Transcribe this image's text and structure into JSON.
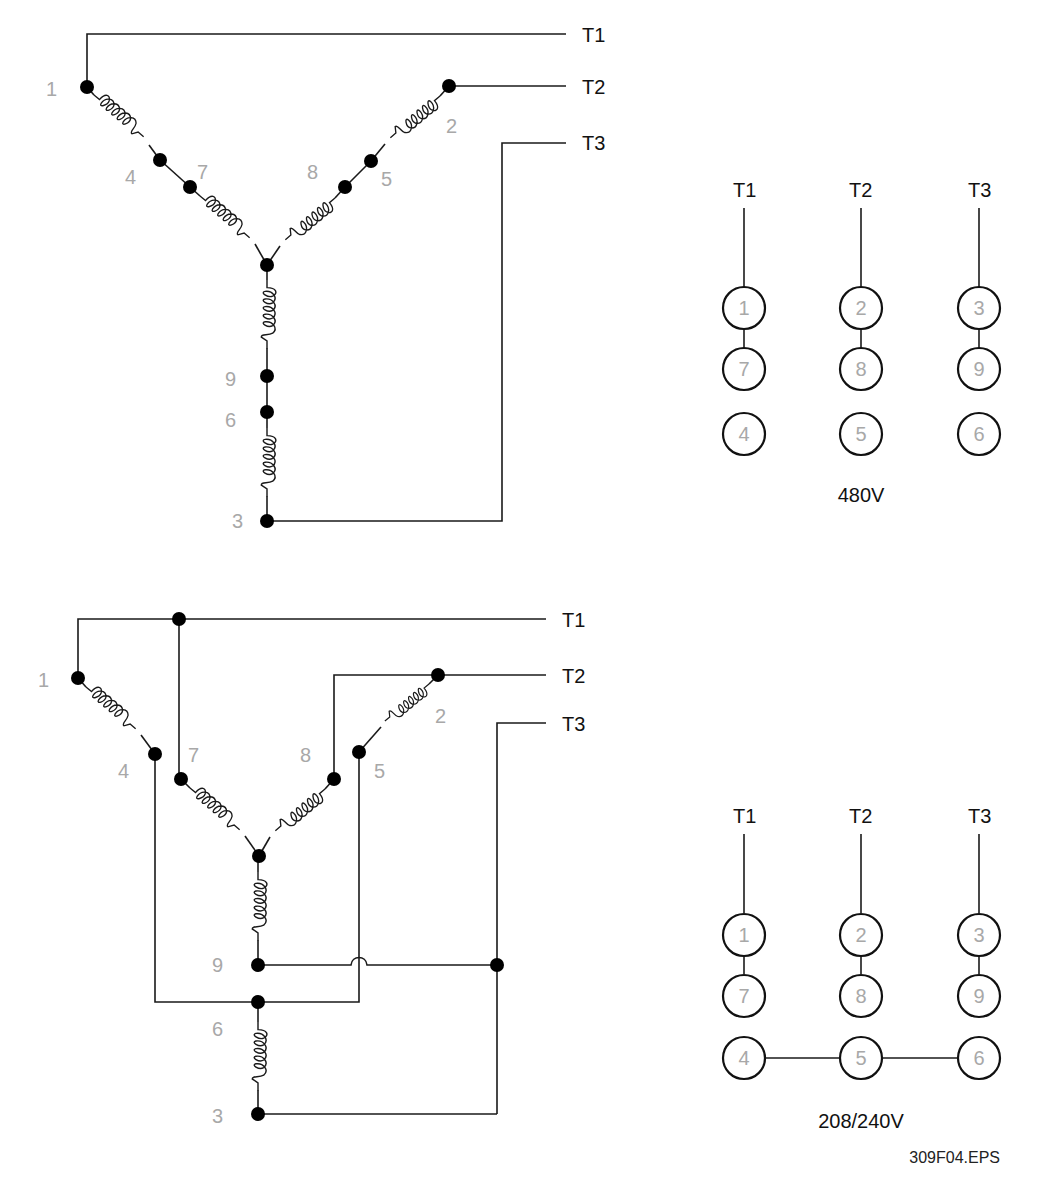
{
  "figure_id": "309F04.EPS",
  "top_diagram": {
    "name": "480V series wye connection",
    "terminals": [
      "T1",
      "T2",
      "T3"
    ],
    "leads": {
      "l1": "1",
      "l2": "2",
      "l3": "3",
      "l4": "4",
      "l5": "5",
      "l6": "6",
      "l7": "7",
      "l8": "8",
      "l9": "9"
    }
  },
  "top_panel": {
    "voltage_label": "480V",
    "columns": [
      {
        "terminal": "T1",
        "rings": [
          "1",
          "7",
          "4"
        ]
      },
      {
        "terminal": "T2",
        "rings": [
          "2",
          "8",
          "5"
        ]
      },
      {
        "terminal": "T3",
        "rings": [
          "3",
          "9",
          "6"
        ]
      }
    ]
  },
  "bottom_diagram": {
    "name": "208/240V parallel wye connection",
    "terminals": [
      "T1",
      "T2",
      "T3"
    ],
    "leads": {
      "l1": "1",
      "l2": "2",
      "l3": "3",
      "l4": "4",
      "l5": "5",
      "l6": "6",
      "l7": "7",
      "l8": "8",
      "l9": "9"
    }
  },
  "bottom_panel": {
    "voltage_label": "208/240V",
    "columns": [
      {
        "terminal": "T1",
        "rings": [
          "1",
          "7",
          "4"
        ]
      },
      {
        "terminal": "T2",
        "rings": [
          "2",
          "8",
          "5"
        ]
      },
      {
        "terminal": "T3",
        "rings": [
          "3",
          "9",
          "6"
        ]
      }
    ]
  },
  "colors": {
    "wire": "#1a1a1a",
    "lead_label": "#a8a8a8",
    "terminal_label": "#111111"
  }
}
